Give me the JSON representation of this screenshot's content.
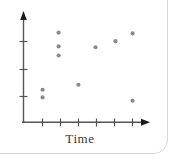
{
  "figure": {
    "name": "scatterplot-figure",
    "background_color": "#ffffff",
    "frame_color": "#d8d8d8",
    "axis_color": "#555555",
    "point_color": "#8a8a8a"
  },
  "chart_data": {
    "type": "scatter",
    "title": "",
    "xlabel": "Time",
    "ylabel": "",
    "grid": false,
    "legend": null,
    "xlim": [
      0,
      8
    ],
    "ylim": [
      0,
      8
    ],
    "x_ticks": [
      1,
      2,
      3,
      4,
      5,
      6,
      7
    ],
    "x_tick_labels": [
      "",
      "",
      "",
      "",
      "",
      "",
      ""
    ],
    "y_ticks": [
      2,
      4,
      6
    ],
    "y_tick_labels": [
      "",
      "",
      ""
    ],
    "x_axis_has_arrow": true,
    "y_axis_has_arrow": true,
    "points": [
      {
        "x": 1.06,
        "y": 2.36
      },
      {
        "x": 1.06,
        "y": 1.8
      },
      {
        "x": 1.95,
        "y": 6.5
      },
      {
        "x": 1.95,
        "y": 5.5
      },
      {
        "x": 1.95,
        "y": 4.84
      },
      {
        "x": 3.05,
        "y": 2.72
      },
      {
        "x": 4.0,
        "y": 5.44
      },
      {
        "x": 5.11,
        "y": 5.88
      },
      {
        "x": 6.06,
        "y": 6.44
      },
      {
        "x": 6.06,
        "y": 1.56
      }
    ],
    "series": [
      {
        "name": "observations",
        "x": [
          1.06,
          1.06,
          1.95,
          1.95,
          1.95,
          3.05,
          4.0,
          5.11,
          6.06,
          6.06
        ],
        "values": [
          2.36,
          1.8,
          6.5,
          5.5,
          4.84,
          2.72,
          5.44,
          5.88,
          6.44,
          1.56
        ]
      }
    ]
  },
  "axis_label": {
    "time": "Time"
  }
}
